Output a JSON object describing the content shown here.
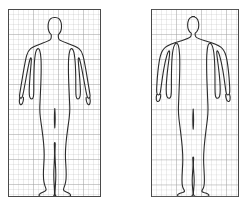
{
  "figure": {
    "background_color": "#ffffff",
    "width": 245,
    "height": 210,
    "panel_count": 2
  },
  "style": {
    "grid_line_color": "#b9b9b9",
    "grid_major_line_color": "#9a9a9a",
    "panel_border_color": "#4a4a4a",
    "outline_color": "#2b2b2b",
    "panel_fill_color": "#ffffff",
    "grid_cell_px": 5,
    "grid_major_every": 5,
    "outline_width_px": 1.1,
    "grid_line_width_px": 0.5,
    "panel_border_width_px": 1
  },
  "panels": [
    {
      "id": "left-panel",
      "name": "lean-body-panel",
      "label": "",
      "x": 8,
      "y": 9,
      "width": 93,
      "height": 188,
      "figure_name": "lean-body-outline",
      "body_type": "lean",
      "description": "Slender human figure, front view, arms at sides",
      "grid_columns": 19,
      "grid_rows": 38,
      "silhouette_path": "M 46.4 8.5 C 43.2 8.6 41.0 10.8 40.4 14.0 C 39.9 16.8 40.0 19.6 40.8 22.0 C 41.3 23.6 42.2 24.8 43.2 25.6 C 43.4 27.6 43.3 29.2 42.6 30.3 C 41.4 32.0 38.0 33.0 33.8 34.4 C 29.4 35.9 25.0 37.6 22.6 39.6 C 20.6 41.3 19.4 43.6 18.6 46.6 C 17.5 50.8 16.6 56.0 15.6 61.6 C 14.6 67.4 13.6 73.6 12.8 78.4 C 12.2 81.9 11.8 84.4 11.6 86.0 C 11.4 87.6 11.6 88.6 12.4 89.0 C 13.1 89.4 13.8 89.0 14.2 88.0 C 14.6 87.0 15.0 85.4 15.4 83.4 C 16.2 79.4 17.2 73.8 18.2 68.4 C 19.2 63.0 20.2 57.8 21.0 54.2 C 21.6 51.6 22.0 50.0 22.4 49.2 C 22.7 48.6 23.0 48.6 23.2 49.2 C 23.4 49.9 23.4 51.4 23.2 53.6 C 22.9 57.2 22.4 62.4 22.0 67.8 C 21.6 73.2 21.2 78.6 21.2 82.6 C 21.2 85.2 21.4 87.0 21.8 88.2 C 22.2 89.4 22.8 90.0 23.6 90.0 C 24.5 90.0 25.1 89.2 25.4 87.6 C 25.7 86.0 25.8 83.6 25.8 80.6 C 25.8 75.4 25.8 68.4 26.0 62.0 C 26.2 55.6 26.6 49.8 27.2 46.0 C 27.8 42.2 28.6 40.4 29.6 39.8 C 30.4 39.3 31.2 40.0 31.8 41.8 C 32.4 43.6 32.8 46.4 33.0 50.0 C 33.3 55.4 33.2 62.4 33.0 69.6 C 32.8 76.8 32.4 84.0 32.2 89.6 C 32.0 94.0 31.8 97.2 31.8 99.6 C 31.8 102.6 32.0 105.4 32.4 108.8 C 32.8 112.2 33.4 116.2 34.0 120.6 C 34.6 125.0 35.2 129.8 35.6 134.2 C 36.0 138.6 36.2 142.6 36.2 146.0 C 36.2 149.2 36.0 152.2 35.8 155.4 C 35.6 158.6 35.4 162.0 35.4 165.4 C 35.4 168.4 35.6 171.0 36.0 173.2 C 36.4 175.4 37.0 177.2 37.6 178.6 C 38.0 179.6 38.2 180.4 38.0 181.0 C 37.8 181.7 37.2 182.2 36.2 182.6 C 35.0 183.1 33.6 183.6 32.6 184.2 C 31.6 184.8 31.0 185.5 31.0 186.2 C 31.0 187.0 31.8 187.5 33.4 187.8 C 35.2 188.1 37.8 188.2 40.4 188.2 C 42.6 188.2 44.2 188.0 45.2 187.4 C 46.2 186.8 46.6 185.8 46.6 184.4 C 46.6 182.4 46.4 179.6 46.2 176.4 C 46.0 173.2 45.8 169.6 45.8 166.2 C 45.8 162.2 46.0 158.4 46.2 154.8 C 46.4 151.2 46.6 147.8 46.6 144.6 C 46.6 141.4 46.5 138.6 46.4 136.4 C 46.3 134.6 46.4 133.6 46.8 133.6 C 47.2 133.6 47.3 134.6 47.2 136.4 C 47.1 138.6 47.0 141.4 47.0 144.6 C 47.0 147.8 47.2 151.2 47.4 154.8 C 47.6 158.4 47.8 162.2 47.8 166.2 C 47.8 169.6 47.6 173.2 47.4 176.4 C 47.2 179.6 47.0 182.4 47.0 184.4 C 47.0 185.8 47.4 186.8 48.4 187.4 C 49.4 188.0 51.0 188.2 53.2 188.2 C 55.8 188.2 58.4 188.1 60.2 187.8 C 61.8 187.5 62.6 187.0 62.6 186.2 C 62.6 185.5 62.0 184.8 61.0 184.2 C 60.0 183.6 58.6 183.1 57.4 182.6 C 56.4 182.2 55.8 181.7 55.6 181.0 C 55.4 180.4 55.6 179.6 56.0 178.6 C 56.6 177.2 57.2 175.4 57.6 173.2 C 58.0 171.0 58.2 168.4 58.2 165.4 C 58.2 162.0 58.0 158.6 57.8 155.4 C 57.6 152.2 57.4 149.2 57.4 146.0 C 57.4 142.6 57.6 138.6 58.0 134.2 C 58.4 129.8 59.0 125.0 59.6 120.6 C 60.2 116.2 60.8 112.2 61.2 108.8 C 61.6 105.4 61.8 102.6 61.8 99.6 C 61.8 97.2 61.6 94.0 61.4 89.6 C 61.2 84.0 60.8 76.8 60.6 69.6 C 60.4 62.4 60.3 55.4 60.6 50.0 C 60.8 46.4 61.2 43.6 61.8 41.8 C 62.4 40.0 63.2 39.3 64.0 39.8 C 65.0 40.4 65.8 42.2 66.4 46.0 C 67.0 49.8 67.4 55.6 67.6 62.0 C 67.8 68.4 67.8 75.4 67.8 80.6 C 67.8 83.6 67.9 86.0 68.2 87.6 C 68.5 89.2 69.1 90.0 70.0 90.0 C 70.8 90.0 71.4 89.4 71.8 88.2 C 72.2 87.0 72.4 85.2 72.4 82.6 C 72.4 78.6 72.0 73.2 71.6 67.8 C 71.2 62.4 70.7 57.2 70.4 53.6 C 70.2 51.4 70.2 49.9 70.4 49.2 C 70.6 48.6 70.9 48.6 71.2 49.2 C 71.6 50.0 72.0 51.6 72.6 54.2 C 73.4 57.8 74.4 63.0 75.4 68.4 C 76.4 73.8 77.4 79.4 78.2 83.4 C 78.6 85.4 79.0 87.0 79.4 88.0 C 79.8 89.0 80.5 89.4 81.2 89.0 C 82.0 88.6 82.2 87.6 82.0 86.0 C 81.8 84.4 81.4 81.9 80.8 78.4 C 80.0 73.6 79.0 67.4 78.0 61.6 C 77.0 56.0 76.1 50.8 75.0 46.6 C 74.2 43.6 73.0 41.3 71.0 39.6 C 68.6 37.6 64.2 35.9 59.8 34.4 C 55.6 33.0 52.2 32.0 51.0 30.3 C 50.3 29.2 50.2 27.6 50.4 25.6 C 51.4 24.8 52.3 23.6 52.8 22.0 C 53.6 19.6 53.7 16.8 53.2 14.0 C 52.6 10.8 50.4 8.6 47.2 8.5 Z",
      "left_hand_path": "M 11.8 88.6 C 11.4 90.4 11.2 92.6 11.6 94.2 C 11.9 95.4 12.6 96.0 13.4 95.6 C 14.2 95.2 14.8 93.8 15.2 92.0 C 15.5 90.6 15.6 89.4 15.4 88.4",
      "right_hand_path": "M 81.8 88.6 C 82.2 90.4 82.4 92.6 82.0 94.2 C 81.7 95.4 81.0 96.0 80.2 95.6 C 79.4 95.2 78.8 93.8 78.4 92.0 C 78.1 90.6 78.0 89.4 78.2 88.4",
      "crotch_path": "M 46.8 99.6 C 46.6 102.6 46.4 106.0 46.4 109.6 C 46.4 113.2 46.6 116.6 46.8 119.0 C 47.0 116.6 47.2 113.2 47.2 109.6 C 47.2 106.0 47.0 102.6 46.8 99.6"
    },
    {
      "id": "right-panel",
      "name": "heavy-body-panel",
      "label": "",
      "x": 151,
      "y": 9,
      "width": 88,
      "height": 188,
      "figure_name": "heavy-body-outline",
      "body_type": "heavy",
      "description": "Heavyset human figure, front view, arms angled away from sides",
      "grid_columns": 18,
      "grid_rows": 38,
      "silhouette_path": "M 43.6 8.5 C 40.0 8.6 37.6 11.0 37.0 14.4 C 36.4 17.6 36.6 20.8 37.6 23.4 C 38.2 25.0 39.1 26.2 40.2 27.0 C 40.4 28.8 40.2 30.2 39.4 31.2 C 38.0 33.0 34.0 34.2 28.8 36.0 C 23.4 37.8 17.6 40.0 14.6 42.6 C 12.0 44.9 10.4 48.2 9.4 52.4 C 8.3 57.0 7.6 62.8 7.0 68.8 C 6.4 74.8 6.0 81.0 5.8 85.8 C 5.6 89.4 5.6 92.0 5.8 93.6 C 6.0 95.2 6.6 96.0 7.4 96.0 C 8.2 96.0 8.8 95.2 9.2 93.6 C 9.6 92.0 9.8 89.6 10.2 86.4 C 10.8 81.4 11.6 74.6 12.6 68.2 C 13.6 61.8 14.8 55.8 15.8 52.0 C 16.6 49.0 17.2 47.4 17.8 46.8 C 18.2 46.3 18.5 46.6 18.6 47.6 C 18.7 48.8 18.6 51.0 18.2 54.2 C 17.6 59.0 16.8 65.6 16.2 72.2 C 15.6 78.8 15.2 85.4 15.2 90.2 C 15.2 93.4 15.4 95.8 15.8 97.4 C 16.2 99.0 17.0 99.8 18.0 99.8 C 19.0 99.8 19.7 98.8 20.0 96.8 C 20.3 94.8 20.4 91.8 20.4 88.0 C 20.4 81.6 20.4 73.0 20.6 65.2 C 20.8 57.4 21.2 50.4 22.0 45.8 C 22.8 41.2 23.8 39.0 25.0 38.4 C 25.9 37.9 26.8 38.8 27.4 41.0 C 28.0 43.2 28.4 46.6 28.6 51.0 C 28.9 57.6 28.8 66.0 28.6 74.8 C 28.4 83.6 28.0 92.4 27.8 99.2 C 27.6 104.6 27.4 108.6 27.4 111.6 C 27.4 115.2 27.6 118.6 28.0 122.8 C 28.4 127.0 29.0 131.8 29.6 137.2 C 30.2 142.6 30.8 148.4 31.2 153.8 C 31.6 159.2 31.8 164.0 31.8 168.2 C 31.8 172.0 31.6 175.6 31.4 179.4 C 31.2 183.2 31.0 187.2 31.0 191.2 C 31.0 194.2 31.2 196.6 31.6 198.4 C 31.9 199.8 32.4 201.0 33.0 202.0 C 33.4 202.8 33.6 203.4 33.4 203.8 C 33.2 204.3 32.6 204.6 31.6 205.0 C 30.4 205.4 29.0 205.8 28.0 206.3 C 27.0 206.8 26.4 207.4 26.4 208.0 C 26.4 208.7 27.2 209.1 28.8 209.3 C 30.6 209.6 33.2 209.7 35.8 209.7 C 38.0 209.7 39.6 209.5 40.6 209.0 C 41.6 208.5 42.0 207.6 42.0 206.4 C 42.0 204.8 41.8 202.6 41.6 200.0 C 41.4 197.4 41.2 194.6 41.2 191.8 C 41.2 188.6 41.4 185.6 41.6 182.6 C 41.8 179.6 42.0 176.8 42.0 174.2 C 42.0 171.6 41.9 169.4 41.8 167.6 C 41.7 166.2 41.8 165.4 42.2 165.4 C 42.6 165.4 42.7 166.2 42.6 167.6 C 42.5 169.4 42.4 171.6 42.4 174.2 C 42.4 176.8 42.6 179.6 42.8 182.6 C 43.0 185.6 43.2 188.6 43.2 191.8 C 43.2 194.6 43.0 197.4 42.8 200.0 C 42.6 202.6 42.4 204.8 42.4 206.4 C 42.4 207.6 42.8 208.5 43.8 209.0 C 44.8 209.5 46.4 209.7 48.6 209.7 C 51.2 209.7 53.8 209.6 55.6 209.3 C 57.2 209.1 58.0 208.7 58.0 208.0 C 58.0 207.4 57.4 206.8 56.4 206.3 C 55.4 205.8 54.0 205.4 52.8 205.0 C 51.8 204.6 51.2 204.3 51.0 203.8 C 50.8 203.4 51.0 202.8 51.4 202.0 C 52.0 201.0 52.5 199.8 52.8 198.4 C 53.2 196.6 53.4 194.2 53.4 191.2 C 53.4 187.2 53.2 183.2 53.0 179.4 C 52.8 175.6 52.6 172.0 52.6 168.2 C 52.6 164.0 52.8 159.2 53.2 153.8 C 53.6 148.4 54.2 142.6 54.8 137.2 C 55.4 131.8 56.0 127.0 56.4 122.8 C 56.8 118.6 57.0 115.2 57.0 111.6 C 57.0 108.6 56.8 104.6 56.6 99.2 C 56.4 92.4 56.0 83.6 55.8 74.8 C 55.6 66.0 55.5 57.6 55.8 51.0 C 56.0 46.6 56.4 43.2 57.0 41.0 C 57.6 38.8 58.5 37.9 59.4 38.4 C 60.6 39.0 61.6 41.2 62.4 45.8 C 63.2 50.4 63.6 57.4 63.8 65.2 C 64.0 73.0 64.0 81.6 64.0 88.0 C 64.0 91.8 64.1 94.8 64.4 96.8 C 64.7 98.8 65.4 99.8 66.4 99.8 C 67.4 99.8 68.2 99.0 68.6 97.4 C 69.0 95.8 69.2 93.4 69.2 90.2 C 69.2 85.4 68.8 78.8 68.2 72.2 C 67.6 65.6 66.8 59.0 66.2 54.2 C 65.8 51.0 65.7 48.8 65.8 47.6 C 65.9 46.6 66.2 46.3 66.6 46.8 C 67.2 47.4 67.8 49.0 68.6 52.0 C 69.6 55.8 70.8 61.8 71.8 68.2 C 72.8 74.6 73.6 81.4 74.2 86.4 C 74.6 89.6 74.8 92.0 75.2 93.6 C 75.6 95.2 76.2 96.0 77.0 96.0 C 77.8 96.0 78.4 95.2 78.6 93.6 C 78.8 92.0 78.8 89.4 78.6 85.8 C 78.4 81.0 78.0 74.8 77.4 68.8 C 76.8 62.8 76.1 57.0 75.0 52.4 C 74.0 48.2 72.4 44.9 69.8 42.6 C 66.8 40.0 61.0 37.8 55.6 36.0 C 50.4 34.2 46.4 33.0 45.0 31.2 C 44.2 30.2 44.0 28.8 44.2 27.0 C 45.3 26.2 46.2 25.0 46.8 23.4 C 47.8 20.8 48.0 17.6 47.4 14.4 C 46.8 11.0 44.4 8.6 40.8 8.5 Z",
      "left_hand_path": "M 5.8 95.4 C 5.2 97.4 5.0 99.8 5.4 101.6 C 5.8 103.0 6.6 103.6 7.4 103.2 C 8.3 102.8 9.0 101.2 9.4 99.2 C 9.7 97.6 9.8 96.2 9.6 95.2",
      "right_hand_path": "M 78.6 95.4 C 79.2 97.4 79.4 99.8 79.0 101.6 C 78.6 103.0 77.8 103.6 77.0 103.2 C 76.1 102.8 75.4 101.2 75.0 99.2 C 74.7 97.6 74.6 96.2 74.8 95.2",
      "crotch_path": "M 42.2 111.6 C 42.0 115.2 41.8 119.4 41.8 123.6 C 41.8 127.8 42.0 131.6 42.2 134.4 C 42.4 131.6 42.6 127.8 42.6 123.6 C 42.6 119.4 42.4 115.2 42.2 111.6"
    }
  ]
}
